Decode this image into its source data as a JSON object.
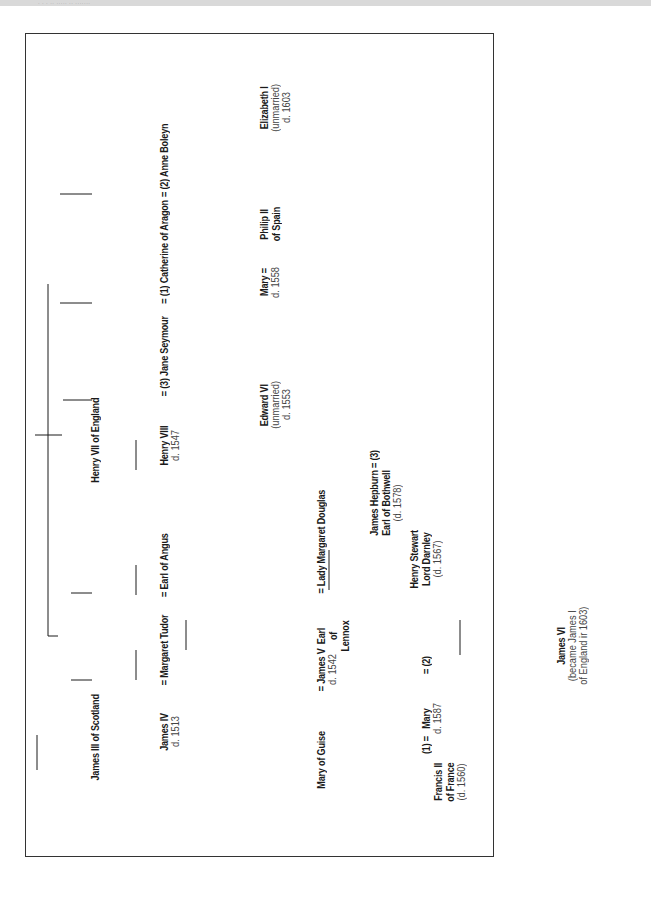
{
  "page": {
    "running_header": "· ·    · ·· ····· ·· ·······"
  },
  "diagram": {
    "type": "family-tree",
    "orientation": "rotated-90-ccw",
    "nodes": {
      "henry_vii": {
        "name": "Henry VII of England"
      },
      "james_iii": {
        "name": "James III of Scotland"
      },
      "anne_boleyn": {
        "name": "= (2) Anne Boleyn"
      },
      "catherine": {
        "name": "= (1) Catherine of Aragon"
      },
      "jane_seymour": {
        "name": "= (3) Jane Seymour"
      },
      "henry_viii": {
        "name": "Henry VIII",
        "note": "d. 1547"
      },
      "earl_of_angus": {
        "name": "= Earl of Angus"
      },
      "margaret_tudor": {
        "name": "= Margaret Tudor"
      },
      "james_iv": {
        "name": "James IV",
        "note": "d. 1513"
      },
      "elizabeth_i": {
        "name": "Elizabeth I",
        "note1": "(unmarried)",
        "note2": "d. 1603"
      },
      "mary_tudor": {
        "name": "Mary =",
        "note": "d. 1558"
      },
      "philip_ii": {
        "name": "Philip II",
        "name2": "of Spain"
      },
      "edward_vi": {
        "name": "Edward VI",
        "note1": "(unmarried)",
        "note2": "d. 1553"
      },
      "lady_margaret_douglas": {
        "name": "= Lady Margaret Douglas"
      },
      "earl_of_lennox": {
        "name": "Earl",
        "name2": "of",
        "name3": "Lennox"
      },
      "james_v": {
        "name": "= James V",
        "note": "d. 1542"
      },
      "mary_of_guise": {
        "name": "Mary of Guise"
      },
      "bothwell": {
        "prefix": "= (3)",
        "name": "James Hepburn",
        "name2": "Earl of Bothwell",
        "note": "(d. 1578)"
      },
      "darnley": {
        "prefix": "= (2)",
        "name": "Henry Stewart",
        "name2": "Lord Darnley",
        "note": "(d. 1567)"
      },
      "mary_queen_of_scots": {
        "prefix": "(1) =",
        "name": "Mary",
        "note": "d. 1587"
      },
      "francis_ii": {
        "name": "Francis II",
        "name2": "of France",
        "note": "(d. 1560)"
      },
      "james_vi": {
        "name": "James VI",
        "note1": "(became James I",
        "note2": "of England ir 1603)"
      }
    },
    "colors": {
      "line": "#1a1a1a",
      "frame": "#333333",
      "header_band": "#d9d9d9"
    }
  }
}
